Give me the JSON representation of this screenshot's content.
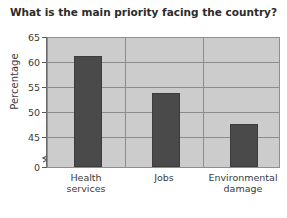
{
  "chart_data": {
    "type": "bar",
    "title": "What is the main priority facing the country?",
    "xlabel": "",
    "ylabel": "Percentage",
    "categories": [
      "Health services",
      "Jobs",
      "Environmental damage"
    ],
    "values": [
      62,
      56,
      51
    ],
    "ylim": [
      44,
      65
    ],
    "yticks": [
      0,
      45,
      50,
      55,
      60,
      65
    ],
    "ytick_labels": [
      "0",
      "45",
      "50",
      "55",
      "60",
      "65"
    ],
    "grid": true,
    "axis_break": true,
    "legend": "none",
    "bar_color": "#4a4a4a",
    "plot_background": "#cccccc",
    "grid_color": "#8c8c8c"
  },
  "categories_display": [
    {
      "line1": "Health",
      "line2": "services"
    },
    {
      "line1": "Jobs",
      "line2": ""
    },
    {
      "line1": "Environmental",
      "line2": "damage"
    }
  ]
}
